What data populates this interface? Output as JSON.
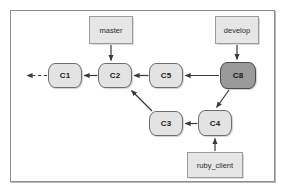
{
  "diagram": {
    "frame": {
      "border_color": "#8e8e8e",
      "background": "#ffffff"
    },
    "colors": {
      "node_fill": "#e3e3e3",
      "node_border": "#6d6d6d",
      "node_highlight_fill": "#9a9a9a",
      "node_highlight_border": "#4a4a4a",
      "label_fill": "#e6e6e6",
      "label_border": "#9c9c9c",
      "edge": "#3a3a3a"
    },
    "commits": [
      {
        "id": "c1",
        "label": "C1",
        "x": 48,
        "y": 63,
        "w": 34,
        "h": 25,
        "highlight": false
      },
      {
        "id": "c2",
        "label": "C2",
        "x": 98,
        "y": 63,
        "w": 34,
        "h": 25,
        "highlight": false
      },
      {
        "id": "c5",
        "label": "C5",
        "x": 149,
        "y": 63,
        "w": 34,
        "h": 25,
        "highlight": false
      },
      {
        "id": "c8",
        "label": "C8",
        "x": 220,
        "y": 62,
        "w": 36,
        "h": 27,
        "highlight": true
      },
      {
        "id": "c3",
        "label": "C3",
        "x": 149,
        "y": 111,
        "w": 34,
        "h": 25,
        "highlight": false
      },
      {
        "id": "c4",
        "label": "C4",
        "x": 198,
        "y": 110,
        "w": 34,
        "h": 26,
        "highlight": false
      }
    ],
    "branch_labels": [
      {
        "id": "master",
        "label": "master",
        "x": 89,
        "y": 16,
        "w": 44,
        "h": 28
      },
      {
        "id": "develop",
        "label": "develop",
        "x": 215,
        "y": 16,
        "w": 44,
        "h": 28
      },
      {
        "id": "ruby_client",
        "label": "ruby_client",
        "x": 187,
        "y": 152,
        "w": 56,
        "h": 26
      }
    ],
    "edges": [
      {
        "id": "c1-to-history",
        "from": "c1",
        "to": "history-ellipsis",
        "style": "dashed",
        "arrow": true
      },
      {
        "id": "c2-to-c1",
        "from": "c2",
        "to": "c1",
        "style": "solid",
        "arrow": true
      },
      {
        "id": "c5-to-c2",
        "from": "c5",
        "to": "c2",
        "style": "solid",
        "arrow": true
      },
      {
        "id": "c8-to-c5",
        "from": "c8",
        "to": "c5",
        "style": "solid",
        "arrow": true
      },
      {
        "id": "c3-to-c2",
        "from": "c3",
        "to": "c2",
        "style": "solid",
        "arrow": true
      },
      {
        "id": "c4-to-c3",
        "from": "c4",
        "to": "c3",
        "style": "solid",
        "arrow": true
      },
      {
        "id": "c8-to-c4",
        "from": "c8",
        "to": "c4",
        "style": "solid",
        "arrow": true
      },
      {
        "id": "master-to-c2",
        "from": "master",
        "to": "c2",
        "style": "solid",
        "arrow": true
      },
      {
        "id": "develop-to-c8",
        "from": "develop",
        "to": "c8",
        "style": "solid",
        "arrow": true
      },
      {
        "id": "ruby_client-to-c4",
        "from": "ruby_client",
        "to": "c4",
        "style": "solid",
        "arrow": true
      }
    ]
  }
}
